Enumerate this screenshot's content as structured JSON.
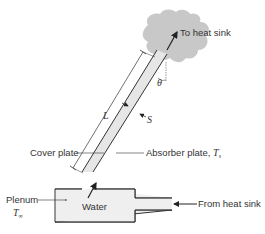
{
  "diagram": {
    "labels": {
      "to_heat_sink": "To heat sink",
      "from_heat_sink": "From heat sink",
      "cover_plate": "Cover plate",
      "absorber_plate": "Absorber plate, ",
      "absorber_symbol": "T",
      "absorber_subscript": "s",
      "plenum": "Plenum",
      "plenum_symbol": "T",
      "plenum_subscript": "∞",
      "water": "Water",
      "length_symbol": "L",
      "spacing_symbol": "S",
      "angle_symbol": "θ"
    },
    "colors": {
      "cloud": "#c8c8c8",
      "channel_fill": "#e6e6e6",
      "plenum_fill": "#efefef",
      "stroke": "#333333",
      "text": "#333333"
    }
  }
}
